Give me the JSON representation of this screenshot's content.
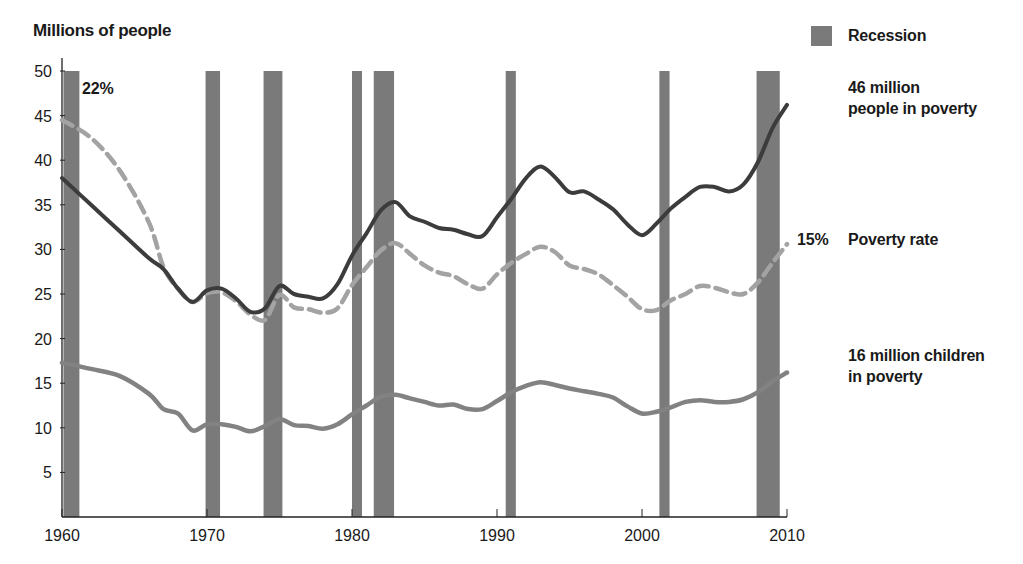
{
  "chart_data": {
    "type": "line",
    "title": "",
    "ylabel": "Millions of people",
    "xlabel": "",
    "xlim": [
      1960,
      2010
    ],
    "ylim": [
      0,
      50
    ],
    "xticks": [
      1960,
      1970,
      1980,
      1990,
      2000,
      2010
    ],
    "yticks": [
      5,
      10,
      15,
      20,
      25,
      30,
      35,
      40,
      45,
      50
    ],
    "grid": false,
    "legend": [
      {
        "name": "Recession",
        "type": "shaded-bar",
        "color": "#7a7a7a"
      }
    ],
    "recessions": [
      {
        "start": 1960.1,
        "end": 1961.2
      },
      {
        "start": 1969.9,
        "end": 1970.9
      },
      {
        "start": 1973.9,
        "end": 1975.2
      },
      {
        "start": 1980.0,
        "end": 1980.6
      },
      {
        "start": 1981.5,
        "end": 1982.9
      },
      {
        "start": 1990.6,
        "end": 1991.3
      },
      {
        "start": 2001.2,
        "end": 2001.9
      },
      {
        "start": 2007.9,
        "end": 2009.5
      }
    ],
    "x": [
      1960,
      1962,
      1964,
      1966,
      1967,
      1968,
      1969,
      1970,
      1971,
      1972,
      1973,
      1974,
      1975,
      1976,
      1977,
      1978,
      1979,
      1980,
      1981,
      1982,
      1983,
      1984,
      1985,
      1986,
      1987,
      1988,
      1989,
      1990,
      1991,
      1992,
      1993,
      1994,
      1995,
      1996,
      1997,
      1998,
      1999,
      2000,
      2001,
      2002,
      2003,
      2004,
      2005,
      2006,
      2007,
      2008,
      2009,
      2010
    ],
    "series": [
      {
        "name": "People in poverty (millions)",
        "style": "solid",
        "color": "#3c3c3c",
        "values": [
          38.0,
          35.0,
          32.0,
          29.0,
          27.8,
          25.6,
          24.1,
          25.4,
          25.6,
          24.5,
          23.0,
          23.4,
          25.9,
          25.0,
          24.7,
          24.5,
          26.1,
          29.3,
          31.8,
          34.4,
          35.3,
          33.7,
          33.1,
          32.4,
          32.2,
          31.7,
          31.5,
          33.6,
          35.7,
          38.0,
          39.3,
          38.1,
          36.4,
          36.5,
          35.6,
          34.5,
          32.8,
          31.6,
          32.9,
          34.6,
          35.9,
          37.0,
          37.0,
          36.5,
          37.3,
          39.8,
          43.6,
          46.2
        ],
        "end_label": "46 million people in poverty"
      },
      {
        "name": "Poverty rate",
        "style": "dashed",
        "color": "#a3a3a3",
        "values": [
          44.5,
          42.5,
          38.8,
          33.0,
          28.0,
          25.6,
          24.1,
          25.1,
          25.2,
          24.2,
          22.7,
          22.1,
          24.9,
          23.5,
          23.3,
          22.9,
          23.4,
          26.0,
          28.0,
          29.9,
          30.7,
          29.5,
          28.2,
          27.4,
          27.0,
          26.1,
          25.6,
          27.2,
          28.5,
          29.5,
          30.3,
          29.7,
          28.2,
          27.8,
          27.2,
          26.0,
          24.7,
          23.3,
          23.2,
          24.3,
          25.0,
          25.9,
          25.7,
          25.2,
          25.0,
          26.3,
          28.5,
          30.6
        ],
        "start_label": "22%",
        "end_label": "15%",
        "label": "Poverty rate"
      },
      {
        "name": "Children in poverty (millions)",
        "style": "solid-light",
        "color": "#828282",
        "values": [
          17.3,
          16.6,
          15.8,
          13.8,
          12.1,
          11.6,
          9.7,
          10.4,
          10.4,
          10.1,
          9.6,
          10.2,
          11.0,
          10.3,
          10.2,
          9.9,
          10.4,
          11.5,
          12.5,
          13.5,
          13.7,
          13.3,
          12.9,
          12.5,
          12.6,
          12.1,
          12.1,
          13.0,
          14.0,
          14.7,
          15.1,
          14.8,
          14.4,
          14.1,
          13.8,
          13.4,
          12.4,
          11.6,
          11.8,
          12.3,
          12.9,
          13.1,
          12.9,
          12.9,
          13.2,
          14.0,
          15.2,
          16.2
        ],
        "end_label": "16 million children in poverty"
      }
    ],
    "annotations": [
      {
        "text": "22%",
        "near": "Poverty rate start (1960)"
      },
      {
        "text": "15%",
        "near": "Poverty rate end (2010)"
      }
    ]
  },
  "labels": {
    "y_axis_title": "Millions of people",
    "legend_recession": "Recession",
    "total_line_label_1": "46 million",
    "total_line_label_2": "people in poverty",
    "rate_start": "22%",
    "rate_end": "15%",
    "rate_label": "Poverty rate",
    "children_label_1": "16 million children",
    "children_label_2": "in poverty"
  }
}
